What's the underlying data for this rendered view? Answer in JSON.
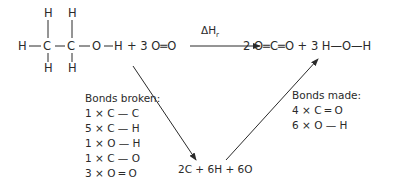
{
  "reactants": {
    "ethanol_atoms": {
      "top_h": [
        "H",
        "H"
      ],
      "row": [
        "H",
        "C",
        "C",
        "O",
        "H"
      ],
      "bottom_h": [
        "H",
        "H"
      ]
    },
    "plus_oxygen": "+ 3 O═O"
  },
  "reaction_arrow": {
    "label": "ΔH",
    "subscript": "r"
  },
  "products": "2 O═C═O + 3 H—O—H",
  "bonds_broken": {
    "heading": "Bonds broken:",
    "items": [
      "1 × C — C",
      "5 × C — H",
      "1 × O — H",
      "1 × C — O",
      "3 × O ═ O"
    ]
  },
  "bonds_made": {
    "heading": "Bonds made:",
    "items": [
      "4 × C ═ O",
      "6 × O — H"
    ]
  },
  "atoms": "2C + 6H + 6O",
  "colors": {
    "ink": "#2a2a2a",
    "background": "#ffffff"
  }
}
